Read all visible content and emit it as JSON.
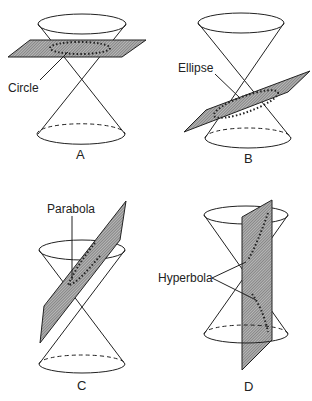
{
  "figure": {
    "panels": [
      {
        "letter": "A",
        "label": "Circle",
        "plane": "horizontal"
      },
      {
        "letter": "B",
        "label": "Ellipse",
        "plane": "tilted"
      },
      {
        "letter": "C",
        "label": "Parabola",
        "plane": "parallel-to-side"
      },
      {
        "letter": "D",
        "label": "Hyperbola",
        "plane": "vertical"
      }
    ]
  },
  "colors": {
    "stroke": "#222222",
    "plane_fill": "#9a9a9a",
    "background": "#ffffff"
  }
}
